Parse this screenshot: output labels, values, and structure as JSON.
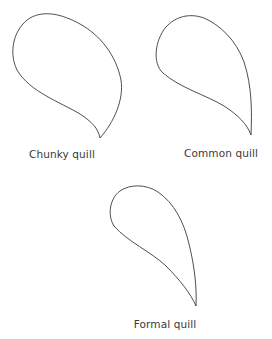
{
  "diagram": {
    "shapes": [
      {
        "id": "chunky",
        "label": "Chunky quill"
      },
      {
        "id": "common",
        "label": "Common quill"
      },
      {
        "id": "formal",
        "label": "Formal quill"
      }
    ]
  },
  "colors": {
    "stroke": "#3a3a3a",
    "text": "#3a3a3a",
    "background": "#ffffff"
  }
}
